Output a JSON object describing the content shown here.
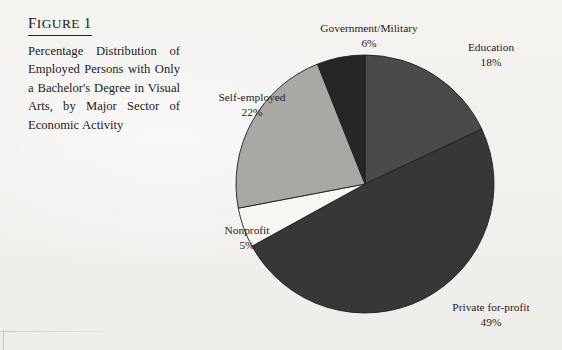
{
  "figure": {
    "label_small": "IGURE",
    "label_initial": "F",
    "label_number": "1",
    "label_full": "Figure 1",
    "caption": "Percentage Distribution of Employed Persons with Only a Bachelor's Degree in Visual Arts, by Major Sector of Economic Activity"
  },
  "chart_data": {
    "type": "pie",
    "title": "Percentage Distribution of Employed Persons with Only a Bachelor's Degree in Visual Arts, by Major Sector of Economic Activity",
    "categories": [
      "Education",
      "Private for-profit",
      "Nonprofit",
      "Self-employed",
      "Government/Military"
    ],
    "values": [
      18,
      49,
      5,
      22,
      6
    ],
    "value_labels": [
      "18%",
      "49%",
      "5%",
      "22%",
      "6%"
    ],
    "colors": [
      "#4b4a49",
      "#383736",
      "#f7f6f3",
      "#a9a8a4",
      "#272625"
    ],
    "start_angle_deg": 0,
    "direction": "clockwise",
    "legend": "none",
    "labels_position": "outside",
    "units": "percent",
    "total": 100,
    "slices": [
      {
        "name": "Government/Military",
        "value": 6,
        "value_label": "6%",
        "label": "Government/Military",
        "color": "#272625"
      },
      {
        "name": "Education",
        "value": 18,
        "value_label": "18%",
        "label": "Education",
        "color": "#4b4a49"
      },
      {
        "name": "Private for-profit",
        "value": 49,
        "value_label": "49%",
        "label": "Private for-profit",
        "color": "#383736"
      },
      {
        "name": "Nonprofit",
        "value": 5,
        "value_label": "5%",
        "label": "Nonprofit",
        "color": "#f7f6f3"
      },
      {
        "name": "Self-employed",
        "value": 22,
        "value_label": "22%",
        "label": "Self-employed",
        "color": "#a9a8a4"
      }
    ]
  }
}
